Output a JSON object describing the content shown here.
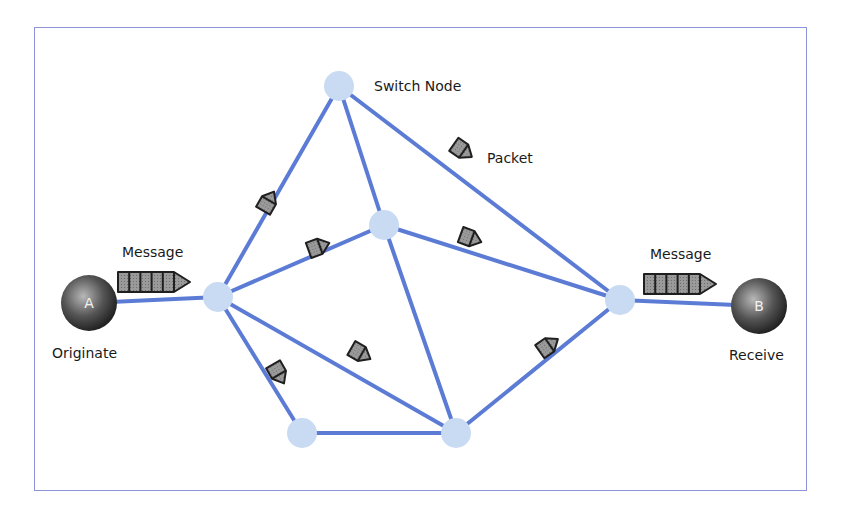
{
  "diagram": {
    "type": "packet-switching-network",
    "colors": {
      "link": "#5b7bd5",
      "switch_node": "#c9dbf2",
      "endpoint_dark": "#2b2b2b",
      "endpoint_light": "#9a9a9a",
      "packet_fill": "#8f8f8f",
      "packet_stroke": "#1f1f1f",
      "frame": "#8d93d6"
    },
    "endpoints": [
      {
        "id": "A",
        "label": "A",
        "caption": "Originate",
        "x": 89,
        "y": 303,
        "r": 28
      },
      {
        "id": "B",
        "label": "B",
        "caption": "Receive",
        "x": 759,
        "y": 306,
        "r": 28
      }
    ],
    "switch_nodes": [
      {
        "id": "n1",
        "x": 218,
        "y": 297
      },
      {
        "id": "n2",
        "x": 339,
        "y": 86
      },
      {
        "id": "n3",
        "x": 384,
        "y": 225
      },
      {
        "id": "n4",
        "x": 302,
        "y": 433
      },
      {
        "id": "n5",
        "x": 456,
        "y": 433
      },
      {
        "id": "n6",
        "x": 620,
        "y": 300
      }
    ],
    "links": [
      [
        "A",
        "n1"
      ],
      [
        "n1",
        "n2"
      ],
      [
        "n1",
        "n3"
      ],
      [
        "n1",
        "n4"
      ],
      [
        "n1",
        "n5"
      ],
      [
        "n2",
        "n3"
      ],
      [
        "n2",
        "n6"
      ],
      [
        "n3",
        "n5"
      ],
      [
        "n3",
        "n6"
      ],
      [
        "n4",
        "n5"
      ],
      [
        "n5",
        "n6"
      ],
      [
        "n6",
        "B"
      ]
    ],
    "labels": {
      "switch_node": "Switch Node",
      "packet": "Packet",
      "message_left": "Message",
      "message_right": "Message",
      "originate": "Originate",
      "receive": "Receive"
    },
    "messages": [
      {
        "x": 118,
        "y": 272,
        "segments": 5
      },
      {
        "x": 644,
        "y": 274,
        "segments": 5
      }
    ],
    "packets": [
      {
        "x": 268,
        "y": 202,
        "angle": -60
      },
      {
        "x": 318,
        "y": 247,
        "angle": -20
      },
      {
        "x": 462,
        "y": 150,
        "angle": 35
      },
      {
        "x": 470,
        "y": 238,
        "angle": 20
      },
      {
        "x": 278,
        "y": 373,
        "angle": 60
      },
      {
        "x": 360,
        "y": 353,
        "angle": 30
      },
      {
        "x": 548,
        "y": 346,
        "angle": -35
      }
    ]
  }
}
